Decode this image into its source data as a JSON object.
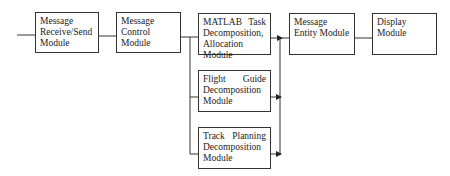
{
  "diagram": {
    "type": "block-diagram",
    "nodes": [
      {
        "id": "receive_send",
        "label": "Message Receive/Send Module"
      },
      {
        "id": "control",
        "label": "Message Control Module"
      },
      {
        "id": "matlab",
        "label": "MATLAB Task Decomposition, Allocation Module"
      },
      {
        "id": "flight_guide",
        "label": "Flight Guide Decomposition Module"
      },
      {
        "id": "track_planning",
        "label": "Track Planning Decomposition Module"
      },
      {
        "id": "entity",
        "label": "Message Entity Module"
      },
      {
        "id": "display",
        "label": "Display Module"
      }
    ],
    "edges": [
      {
        "from": "input",
        "to": "receive_send",
        "arrow": false
      },
      {
        "from": "receive_send",
        "to": "control",
        "arrow": false
      },
      {
        "from": "control",
        "to": "matlab",
        "arrow": false
      },
      {
        "from": "control",
        "to": "flight_guide",
        "arrow": false
      },
      {
        "from": "control",
        "to": "track_planning",
        "arrow": false
      },
      {
        "from": "matlab",
        "to": "entity",
        "arrow": true
      },
      {
        "from": "flight_guide",
        "to": "entity",
        "arrow": true
      },
      {
        "from": "track_planning",
        "to": "entity",
        "arrow": true
      },
      {
        "from": "entity",
        "to": "display",
        "arrow": false
      }
    ]
  },
  "labels": {
    "receive_send": "Message Receive/Send Module",
    "control": "Message Control Module",
    "matlab": "MATLAB Task Decomposition, Allocation Module",
    "flight_guide": "Flight Guide Decomposition Module",
    "track_planning": "Track Planning Decomposition Module",
    "entity": "Message Entity Module",
    "display": "Display Module"
  }
}
